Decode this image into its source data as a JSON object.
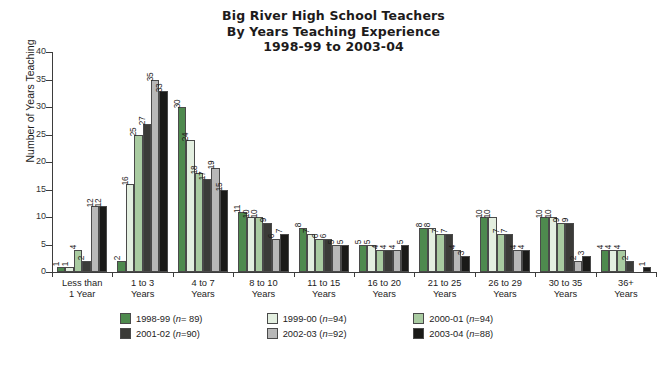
{
  "chart_data": {
    "type": "bar",
    "title": "Big River High School Teachers By Years Teaching Experience 1998-99 to 2003-04",
    "title_lines": [
      "Big River High School Teachers",
      "By Years Teaching Experience",
      "1998-99 to 2003-04"
    ],
    "xlabel": "",
    "ylabel": "Number of Years Teaching",
    "ylim": [
      0,
      40
    ],
    "yticks": [
      0,
      5,
      10,
      15,
      20,
      25,
      30,
      35,
      40
    ],
    "grid": false,
    "legend_position": "bottom",
    "categories": [
      "Less than 1 Year",
      "1 to 3 Years",
      "4 to 7 Years",
      "8 to 10 Years",
      "11 to 15 Years",
      "16 to 20 Years",
      "21 to 25 Years",
      "26 to 29 Years",
      "30 to 35 Years",
      "36+ Years"
    ],
    "category_lines": [
      [
        "Less than",
        "1 Year"
      ],
      [
        "1 to 3",
        "Years"
      ],
      [
        "4 to 7",
        "Years"
      ],
      [
        "8 to 10",
        "Years"
      ],
      [
        "11 to 15",
        "Years"
      ],
      [
        "16 to 20",
        "Years"
      ],
      [
        "21 to 25",
        "Years"
      ],
      [
        "26 to 29",
        "Years"
      ],
      [
        "30 to 35",
        "Years"
      ],
      [
        "36+",
        "Years"
      ]
    ],
    "series": [
      {
        "name": "1998-99",
        "n": 89,
        "color": "#4e8a4e",
        "values": [
          1,
          2,
          30,
          11,
          8,
          5,
          8,
          10,
          10,
          4
        ]
      },
      {
        "name": "1999-00",
        "n": 94,
        "color": "#e3efe0",
        "values": [
          1,
          16,
          24,
          10,
          7,
          5,
          8,
          10,
          10,
          4
        ]
      },
      {
        "name": "2000-01",
        "n": 94,
        "color": "#a9cba1",
        "values": [
          4,
          25,
          18,
          10,
          6,
          4,
          7,
          7,
          9,
          4
        ]
      },
      {
        "name": "2001-02",
        "n": 90,
        "color": "#3b3b38",
        "values": [
          2,
          27,
          17,
          9,
          6,
          4,
          7,
          7,
          9,
          2
        ]
      },
      {
        "name": "2002-03",
        "n": 92,
        "color": "#b8b8b8",
        "values": [
          12,
          35,
          19,
          6,
          5,
          4,
          4,
          4,
          2,
          0
        ]
      },
      {
        "name": "2003-04",
        "n": 88,
        "color": "#1a1a18",
        "values": [
          12,
          33,
          15,
          7,
          5,
          5,
          3,
          4,
          3,
          1
        ]
      }
    ]
  },
  "legend": {
    "items": [
      {
        "label": "1998-99 (",
        "n_prefix": "n",
        "n_value": "= 89)",
        "color": "#4e8a4e"
      },
      {
        "label": "1999-00 (",
        "n_prefix": "n",
        "n_value": "=94)",
        "color": "#e3efe0"
      },
      {
        "label": "2000-01 (",
        "n_prefix": "n",
        "n_value": "=94)",
        "color": "#a9cba1"
      },
      {
        "label": "2001-02 (",
        "n_prefix": "n",
        "n_value": "=90)",
        "color": "#3b3b38"
      },
      {
        "label": "2002-03 (",
        "n_prefix": "n",
        "n_value": "=92)",
        "color": "#b8b8b8"
      },
      {
        "label": "2003-04 (",
        "n_prefix": "n",
        "n_value": "=88)",
        "color": "#1a1a18"
      }
    ]
  }
}
